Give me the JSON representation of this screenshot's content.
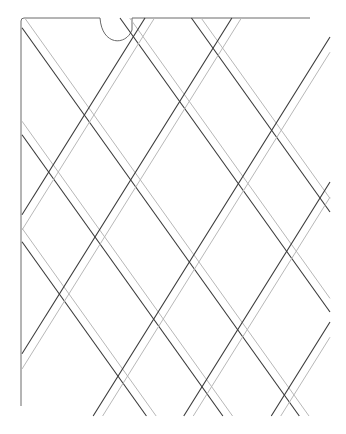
{
  "figure": {
    "colors": {
      "background": "#ffffff",
      "dark_line": "#3a3a3a",
      "light_line": "#b8b8b8",
      "frame": "#6a6a6a"
    },
    "frame": {
      "top_left": [
        21,
        18
      ],
      "top_right_x": 310,
      "left_bottom_y": 406,
      "notch": {
        "x_start": 100,
        "x_end": 132,
        "depth": 28
      }
    },
    "lattice": {
      "down_right_slope": 1.4,
      "up_right_slope": -1.6,
      "band_gap": 8,
      "down_right_offsets": [
        211,
        104,
        -3,
        -150,
        -250
      ],
      "up_right_offsets": [
        250,
        389,
        565,
        710,
        850
      ],
      "clip": {
        "x_min": 22,
        "x_max": 330,
        "y_min": 18,
        "y_max": 416
      }
    }
  }
}
